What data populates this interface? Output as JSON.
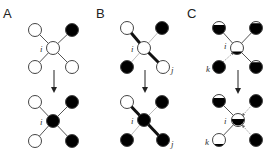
{
  "figure": {
    "panels": [
      {
        "label": "A",
        "top": {
          "center": {
            "label": "i",
            "state": "white"
          },
          "neighbors": {
            "top_left": {
              "state": "white"
            },
            "top_right": {
              "state": "black"
            },
            "bottom_left": {
              "state": "white"
            },
            "bottom_right": {
              "state": "white"
            }
          }
        },
        "bottom": {
          "center": {
            "label": "i",
            "state": "black"
          },
          "neighbors": {
            "top_left": {
              "state": "white"
            },
            "top_right": {
              "state": "black"
            },
            "bottom_left": {
              "state": "white"
            },
            "bottom_right": {
              "state": "black"
            }
          }
        }
      },
      {
        "label": "B",
        "top": {
          "center": {
            "label": "i",
            "state": "white"
          },
          "neighbors": {
            "top_left": {
              "state": "white"
            },
            "top_right": {
              "state": "black"
            },
            "bottom_left": {
              "state": "black"
            },
            "bottom_right": {
              "state": "white",
              "label": "j"
            }
          }
        },
        "bottom": {
          "center": {
            "label": "i",
            "state": "black"
          },
          "neighbors": {
            "top_left": {
              "state": "white"
            },
            "top_right": {
              "state": "black"
            },
            "bottom_left": {
              "state": "black"
            },
            "bottom_right": {
              "state": "black",
              "label": "j"
            }
          }
        }
      },
      {
        "label": "C",
        "top": {
          "center": {
            "label": "i",
            "state": "mostly-white"
          },
          "neighbors": {
            "top_left": {
              "state": "mostly-black"
            },
            "top_right": {
              "state": "mostly-black"
            },
            "bottom_left": {
              "state": "black",
              "label": "k"
            },
            "bottom_right": {
              "state": "mostly-black"
            }
          }
        },
        "bottom": {
          "center": {
            "label": "i",
            "state": "half"
          },
          "neighbors": {
            "top_left": {
              "state": "mostly-black"
            },
            "top_right": {
              "state": "black"
            },
            "bottom_left": {
              "state": "mostly-white",
              "label": "k"
            },
            "bottom_right": {
              "state": "black"
            }
          }
        }
      }
    ]
  }
}
